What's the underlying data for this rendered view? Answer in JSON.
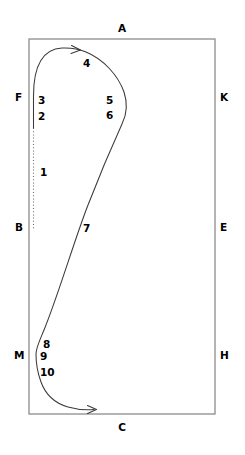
{
  "figure": {
    "title": "",
    "type": "line-diagram",
    "canvas": {
      "width": 245,
      "height": 455
    },
    "colors": {
      "background": "#ffffff",
      "boundary_stroke": "#8d8d8d",
      "path_stroke": "#3a3a3a",
      "dotted_stroke": "#6a6a6a",
      "label_fill": "#000000"
    },
    "boundary": {
      "name": "rectangle-frame",
      "x": 29,
      "y": 39,
      "width": 186,
      "height": 375
    },
    "corner_labels": [
      {
        "id": "A",
        "text": "A",
        "x": 122,
        "y": 32,
        "anchor": "middle",
        "side": "top"
      },
      {
        "id": "F",
        "text": "F",
        "x": 15,
        "y": 101,
        "anchor": "start",
        "side": "left"
      },
      {
        "id": "K",
        "text": "K",
        "x": 220,
        "y": 101,
        "anchor": "start",
        "side": "right"
      },
      {
        "id": "B",
        "text": "B",
        "x": 15,
        "y": 231,
        "anchor": "start",
        "side": "left"
      },
      {
        "id": "E",
        "text": "E",
        "x": 220,
        "y": 231,
        "anchor": "start",
        "side": "right"
      },
      {
        "id": "M",
        "text": "M",
        "x": 14,
        "y": 359,
        "anchor": "start",
        "side": "left"
      },
      {
        "id": "H",
        "text": "H",
        "x": 220,
        "y": 359,
        "anchor": "start",
        "side": "right"
      },
      {
        "id": "C",
        "text": "C",
        "x": 122,
        "y": 431,
        "anchor": "middle",
        "side": "bottom"
      }
    ],
    "number_labels": [
      {
        "id": "1",
        "text": "1",
        "x": 40,
        "y": 176,
        "anchor": "start"
      },
      {
        "id": "2",
        "text": "2",
        "x": 38,
        "y": 120,
        "anchor": "start"
      },
      {
        "id": "3",
        "text": "3",
        "x": 38,
        "y": 104,
        "anchor": "start"
      },
      {
        "id": "4",
        "text": "4",
        "x": 83,
        "y": 67,
        "anchor": "start"
      },
      {
        "id": "5",
        "text": "5",
        "x": 106,
        "y": 104,
        "anchor": "start"
      },
      {
        "id": "6",
        "text": "6",
        "x": 106,
        "y": 119,
        "anchor": "start"
      },
      {
        "id": "7",
        "text": "7",
        "x": 83,
        "y": 232,
        "anchor": "start"
      },
      {
        "id": "8",
        "text": "8",
        "x": 43,
        "y": 348,
        "anchor": "start"
      },
      {
        "id": "9",
        "text": "9",
        "x": 40,
        "y": 360,
        "anchor": "start"
      },
      {
        "id": "10",
        "text": "10",
        "x": 40,
        "y": 376,
        "anchor": "start"
      }
    ],
    "paths": {
      "dotted_segment": {
        "name": "dotted-vertical-tail",
        "d": "M 33.5 128 L 33.5 229"
      },
      "main_curve": {
        "name": "continuous-flow-curve",
        "d": "M 33.5 128 L 33.5 96 C 33.5 64 44 49 62 48 C 72 47.5 80 49.5 86 52 C 103 59 118 75 124 92 C 128 104 127 114 122 124 C 112 146 100 174 88 205 C 74 241 58 296 44 330 C 39 342 36 348 36 354 C 36 362 38 374 41 382 C 45 393 54 403 68 407 C 78 410 86 410 94 409.5"
      },
      "arrow_top": {
        "name": "arrowhead-top",
        "d": "M 71.5 45.5 L 80.5 50 L 71 53.5"
      },
      "arrow_bottom": {
        "name": "arrowhead-bottom",
        "d": "M 87.5 405.5 L 96.5 409.5 L 87.5 413.5"
      }
    }
  }
}
